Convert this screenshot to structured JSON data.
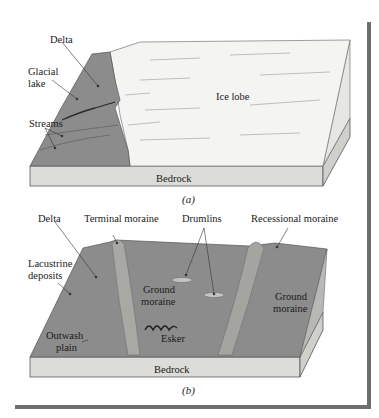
{
  "figure": {
    "panel_a": {
      "caption": "(a)",
      "labels": {
        "delta": "Delta",
        "glacial_lake_1": "Glacial",
        "glacial_lake_2": "lake",
        "streams": "Streams",
        "ice_lobe": "Ice lobe",
        "bedrock": "Bedrock"
      }
    },
    "panel_b": {
      "caption": "(b)",
      "labels": {
        "delta": "Delta",
        "terminal_moraine": "Terminal moraine",
        "drumlins": "Drumlins",
        "recessional_moraine": "Recessional moraine",
        "lacustrine_1": "Lacustrine",
        "lacustrine_2": "deposits",
        "ground_moraine_left_1": "Ground",
        "ground_moraine_left_2": "moraine",
        "ground_moraine_right_1": "Ground",
        "ground_moraine_right_2": "moraine",
        "outwash_1": "Outwash",
        "outwash_2": "plain",
        "esker": "Esker",
        "bedrock": "Bedrock"
      }
    },
    "colors": {
      "land": "#8c8c8c",
      "ice": "#f4f4f2",
      "bedrock": "#dcdcd8",
      "frame": "#6e6e6e"
    }
  }
}
